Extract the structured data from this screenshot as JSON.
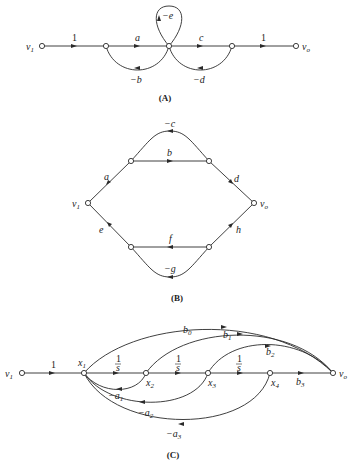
{
  "diagrams": {
    "A": {
      "caption": "(A)",
      "nodes": {
        "v1": "v",
        "v1_sub": "1",
        "vo": "v",
        "vo_sub": "o"
      },
      "gains": {
        "in": "1",
        "a": "a",
        "c": "c",
        "out": "1",
        "self": "−e",
        "fb_b": "−b",
        "fb_d": "−d"
      }
    },
    "B": {
      "caption": "(B)",
      "nodes": {
        "v1": "v",
        "v1_sub": "1",
        "vo": "v",
        "vo_sub": "o"
      },
      "gains": {
        "a": "a",
        "b": "b",
        "c": "−c",
        "d": "d",
        "e": "e",
        "f": "f",
        "g": "−g",
        "h": "h"
      }
    },
    "C": {
      "caption": "(C)",
      "nodes": {
        "v1": "v",
        "v1_sub": "1",
        "x1": "x",
        "x1_sub": "1",
        "x2": "x",
        "x2_sub": "2",
        "x3": "x",
        "x3_sub": "3",
        "x4": "x",
        "x4_sub": "4",
        "vo": "v",
        "vo_sub": "o"
      },
      "gains": {
        "in": "1",
        "int1_num": "1",
        "int1_den": "s",
        "int2_num": "1",
        "int2_den": "s",
        "int3_num": "1",
        "int3_den": "s",
        "b0": "b",
        "b0_sub": "0",
        "b1": "b",
        "b1_sub": "1",
        "b2": "b",
        "b2_sub": "2",
        "b3": "b",
        "b3_sub": "3",
        "a1": "−a",
        "a1_sub": "1",
        "a2": "−a",
        "a2_sub": "2",
        "a3": "−a",
        "a3_sub": "3"
      }
    }
  }
}
